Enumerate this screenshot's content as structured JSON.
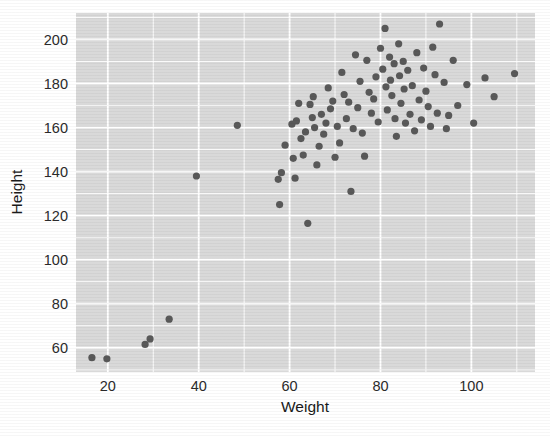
{
  "chart_data": {
    "type": "scatter",
    "title": "",
    "xlabel": "Weight",
    "ylabel": "Height",
    "xlim": [
      13,
      114
    ],
    "ylim": [
      49,
      212
    ],
    "xticks": [
      20,
      40,
      60,
      80,
      100
    ],
    "yticks": [
      60,
      80,
      100,
      120,
      140,
      160,
      180,
      200
    ],
    "grid": true,
    "legend": "none",
    "point_color": "#595959",
    "panel_color": "#d9d9d9",
    "gridline_color": "#ffffff",
    "point_size": 3.6,
    "series": [
      {
        "name": "observations",
        "x": [
          16.5,
          19.8,
          28.2,
          29.3,
          33.5,
          39.5,
          48.5,
          57.5,
          57.8,
          58.2,
          59.0,
          60.5,
          60.8,
          61.2,
          61.5,
          62.0,
          62.5,
          63.0,
          63.5,
          64.0,
          64.5,
          65.0,
          65.2,
          65.5,
          66.0,
          66.5,
          67.0,
          67.5,
          68.0,
          68.5,
          69.0,
          69.5,
          70.0,
          70.5,
          71.0,
          71.5,
          72.0,
          72.5,
          73.0,
          73.5,
          74.0,
          74.5,
          75.0,
          75.5,
          76.0,
          76.5,
          77.0,
          77.5,
          78.0,
          78.5,
          79.0,
          79.5,
          80.0,
          80.5,
          81.0,
          81.2,
          81.5,
          82.0,
          82.2,
          82.5,
          83.0,
          83.2,
          83.5,
          84.0,
          84.2,
          84.5,
          85.0,
          85.2,
          85.5,
          86.0,
          86.5,
          87.0,
          87.5,
          88.0,
          88.5,
          89.0,
          89.5,
          90.0,
          90.5,
          91.0,
          91.5,
          92.0,
          92.5,
          93.0,
          94.0,
          94.5,
          95.0,
          96.0,
          97.0,
          99.0,
          100.5,
          103.0,
          105.0,
          109.5
        ],
        "y": [
          55.5,
          55.0,
          61.5,
          64.0,
          73.0,
          138.0,
          161.0,
          136.5,
          125.0,
          139.5,
          152.0,
          161.5,
          146.0,
          137.0,
          163.0,
          171.0,
          155.0,
          147.5,
          158.0,
          116.5,
          170.5,
          164.5,
          174.0,
          160.0,
          143.0,
          151.5,
          166.0,
          157.0,
          162.0,
          178.0,
          168.5,
          172.0,
          146.5,
          160.5,
          153.0,
          185.0,
          175.0,
          164.0,
          171.5,
          131.0,
          159.5,
          193.0,
          169.0,
          181.0,
          157.5,
          147.0,
          190.5,
          176.0,
          166.5,
          173.0,
          183.0,
          162.5,
          196.0,
          186.5,
          205.0,
          178.5,
          168.0,
          192.0,
          181.5,
          174.5,
          189.0,
          164.0,
          156.0,
          198.0,
          183.5,
          171.0,
          190.0,
          177.5,
          162.0,
          186.0,
          166.0,
          179.0,
          158.5,
          194.0,
          172.5,
          163.5,
          187.0,
          176.5,
          169.5,
          160.5,
          196.5,
          184.0,
          166.5,
          207.0,
          180.5,
          159.5,
          165.5,
          190.5,
          170.0,
          179.5,
          162.0,
          182.5,
          174.0,
          184.5
        ]
      }
    ]
  }
}
